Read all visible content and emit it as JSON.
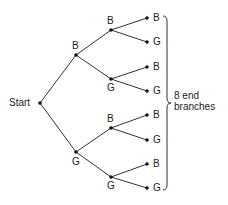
{
  "diagram": {
    "type": "tree",
    "root_label": "Start",
    "level1": [
      {
        "label": "B",
        "x": 76,
        "y": 55
      },
      {
        "label": "G",
        "x": 76,
        "y": 152
      }
    ],
    "level2": [
      {
        "label": "B",
        "x": 111,
        "y": 30
      },
      {
        "label": "G",
        "x": 111,
        "y": 79
      },
      {
        "label": "B",
        "x": 111,
        "y": 128
      },
      {
        "label": "G",
        "x": 111,
        "y": 177
      }
    ],
    "leaves": [
      {
        "label": "B",
        "y": 18
      },
      {
        "label": "G",
        "y": 42
      },
      {
        "label": "B",
        "y": 67
      },
      {
        "label": "G",
        "y": 91
      },
      {
        "label": "B",
        "y": 115
      },
      {
        "label": "G",
        "y": 140
      },
      {
        "label": "B",
        "y": 164
      },
      {
        "label": "G",
        "y": 188
      }
    ],
    "brace_annotation": {
      "line1": "8 end",
      "line2": "branches"
    },
    "line_color": "#333333"
  }
}
